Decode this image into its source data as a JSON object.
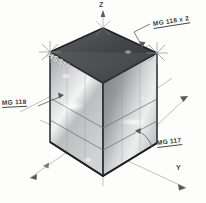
{
  "drawing": {
    "title_text": "",
    "background_color": "#fdfdfc",
    "ink_color": "#3a3a3a"
  },
  "axes": [
    {
      "name": "z-axis",
      "label": "Z",
      "direction": "up"
    },
    {
      "name": "y-axis",
      "label": "Y",
      "direction": "down-right"
    },
    {
      "name": "x-axis",
      "label": "",
      "direction": "down-left"
    }
  ],
  "annotations": [
    {
      "name": "annotation-top-right",
      "text": "MG 118 x 2"
    },
    {
      "name": "annotation-left",
      "text": "MG 118"
    },
    {
      "name": "annotation-bottom-right",
      "text": "MG 117"
    }
  ],
  "face_labels": [
    {
      "name": "face-label-left",
      "text": "HSSU"
    }
  ],
  "object": {
    "name": "glass-cube",
    "kind": "transparent-box",
    "top_face_shade": "#4a4a4a",
    "front_face_shade": "#b9bcbd",
    "side_face_shade": "#8d9193",
    "edge_color": "#2b2b2b"
  },
  "markers": [
    {
      "name": "sparkle-top-left"
    },
    {
      "name": "sparkle-top-right"
    },
    {
      "name": "sparkle-top-apex"
    }
  ]
}
